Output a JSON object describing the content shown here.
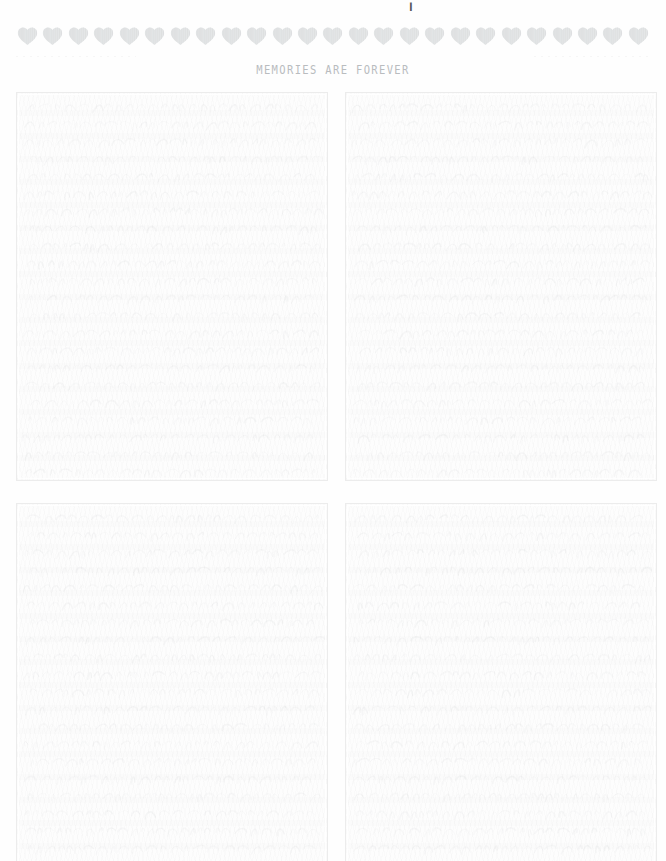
{
  "page": {
    "background_color": "#fefefe",
    "title_clipped_glyph": "¦",
    "caption": "MEMORIES ARE FOREVER",
    "caption_color": "#b9bcbf"
  },
  "heart_banner": {
    "icon_name": "heart-icon",
    "count": 25,
    "color": "#e4e6e7",
    "stripe_color": "#d8dadb"
  },
  "divider": {
    "style": "dashed",
    "color": "#f2f2f2"
  },
  "photo_grid": {
    "columns": 2,
    "rows": 2,
    "slots": [
      {
        "position": "top-left",
        "label": ""
      },
      {
        "position": "top-right",
        "label": ""
      },
      {
        "position": "bottom-left",
        "label": ""
      },
      {
        "position": "bottom-right",
        "label": ""
      }
    ],
    "border_color": "#ececec",
    "fill_color": "#fdfdfd"
  }
}
